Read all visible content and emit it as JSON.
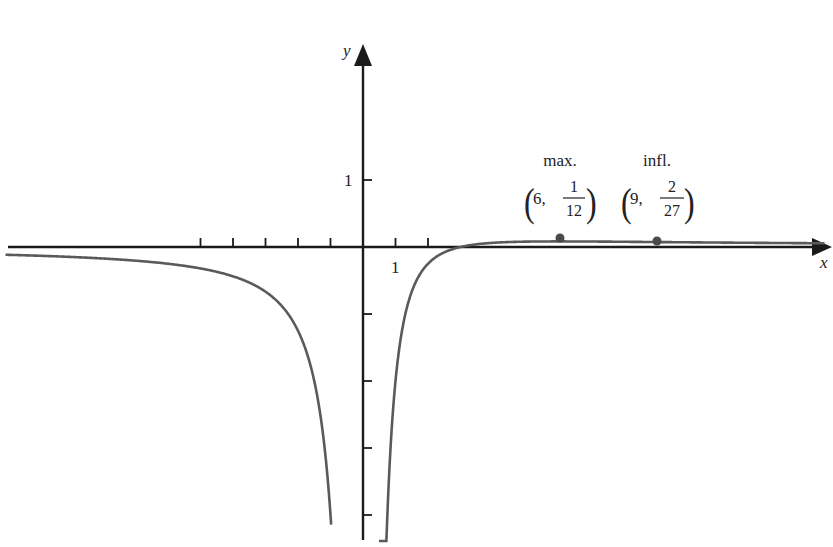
{
  "chart_data": {
    "type": "line",
    "title": "",
    "function": "f(x) = (x - 3) / x^2",
    "xlabel": "x",
    "ylabel": "y",
    "xlim": [
      -11.1,
      14.3
    ],
    "ylim": [
      -4.4,
      3.0
    ],
    "grid": false,
    "legend": null,
    "x_ticks": [
      -5,
      -4,
      -3,
      -2,
      -1,
      1,
      2
    ],
    "x_tick_labels": [
      {
        "value": 1,
        "label": "1"
      }
    ],
    "y_ticks": [
      1,
      -1,
      -2,
      -3,
      -4
    ],
    "y_tick_labels": [
      {
        "value": 1,
        "label": "1"
      }
    ],
    "vertical_asymptote": 0,
    "horizontal_asymptote": 0,
    "x_intercept": 3,
    "series": [
      {
        "name": "f(x)",
        "branch": "left",
        "x": [
          -11,
          -9,
          -7,
          -5,
          -4,
          -3,
          -2,
          -1.5,
          -1,
          -0.8,
          -0.6
        ],
        "y": [
          -0.116,
          -0.148,
          -0.204,
          -0.32,
          -0.4375,
          -0.667,
          -1.25,
          -2.0,
          -4.0,
          -5.94,
          -10.0
        ]
      },
      {
        "name": "f(x)",
        "branch": "right",
        "x": [
          0.5,
          0.6,
          0.8,
          1,
          1.5,
          2,
          3,
          4,
          5,
          6,
          7,
          9,
          11,
          13
        ],
        "y": [
          -10.0,
          -6.67,
          -3.44,
          -2.0,
          -0.667,
          -0.25,
          0,
          0.0625,
          0.08,
          0.0833,
          0.0816,
          0.0741,
          0.0661,
          0.0592
        ]
      }
    ],
    "annotations": [
      {
        "label": "max.",
        "point": [
          6,
          "1/12"
        ],
        "x": 6,
        "y": 0.0833,
        "x_text": "6,",
        "num": "1",
        "den": "12"
      },
      {
        "label": "infl.",
        "point": [
          9,
          "2/27"
        ],
        "x": 9,
        "y": 0.0741,
        "x_text": "9,",
        "num": "2",
        "den": "27"
      }
    ]
  },
  "axes": {
    "x_label": "x",
    "y_label": "y",
    "x_tick_label": "1",
    "y_tick_label": "1"
  },
  "annotations": {
    "max": {
      "title": "max.",
      "x_text": "6,",
      "num": "1",
      "den": "12"
    },
    "infl": {
      "title": "infl.",
      "x_text": "9,",
      "num": "2",
      "den": "27"
    }
  },
  "colors": {
    "axis": "#1a1a1a",
    "curve": "#5a5a5a",
    "point": "#4a4a4a",
    "text": "#222222"
  }
}
